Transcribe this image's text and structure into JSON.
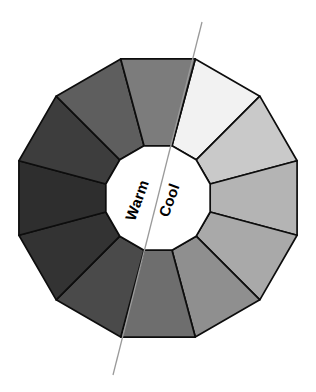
{
  "figure": {
    "name": "color-temperature-wheel",
    "background_color": "#ffffff",
    "outline_color": "#0d0d0d",
    "hub_fill": "#ffffff",
    "divider_color": "#9a9a9a"
  },
  "hub": {
    "labels": [
      {
        "id": "warm",
        "text": "Warm",
        "side": "left",
        "rotation_deg": -70
      },
      {
        "id": "cool",
        "text": "Cool",
        "side": "right",
        "rotation_deg": -70
      }
    ]
  },
  "chart_data": {
    "type": "pie",
    "title": "",
    "subtitle": "",
    "xlabel": "",
    "ylabel": "",
    "legend_position": "none",
    "grid": false,
    "shape": "dodecagon",
    "segment_count": 12,
    "start_angle_deg": -75,
    "center": {
      "x": 158,
      "y": 198
    },
    "outer_radius": 144,
    "inner_radius": 54,
    "categories": [
      "seg-1",
      "seg-2",
      "seg-3",
      "seg-4",
      "seg-5",
      "seg-6",
      "seg-7",
      "seg-8",
      "seg-9",
      "seg-10",
      "seg-11",
      "seg-12"
    ],
    "values": [
      30,
      30,
      30,
      30,
      30,
      30,
      30,
      30,
      30,
      30,
      30,
      30
    ],
    "colors": [
      "#f2f2f2",
      "#c9c9c9",
      "#b4b4b4",
      "#a9a9a9",
      "#8f8f8f",
      "#6e6e6e",
      "#4a4a4a",
      "#333333",
      "#2e2e2e",
      "#3d3d3d",
      "#5e5e5e",
      "#7c7c7c"
    ],
    "annotations": [
      {
        "id": "warm-cool-divider",
        "type": "line",
        "x1": 202,
        "y1": 22,
        "x2": 113,
        "y2": 375
      }
    ]
  }
}
